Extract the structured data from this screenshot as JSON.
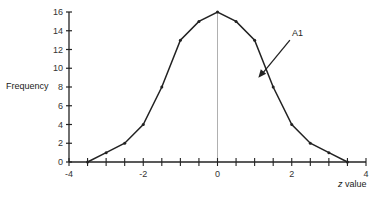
{
  "chart_data": {
    "type": "line",
    "title": "",
    "xlabel_italic": "z",
    "xlabel_rest": " value",
    "xlabel": "z value",
    "ylabel": "Frequency",
    "xlim": [
      -4,
      4
    ],
    "ylim": [
      0,
      16
    ],
    "x_ticks": [
      -4,
      -2,
      0,
      2,
      4
    ],
    "x_minor_step": 0.5,
    "y_ticks": [
      0,
      2,
      4,
      6,
      8,
      10,
      12,
      14,
      16
    ],
    "grid": false,
    "legend": null,
    "series": [
      {
        "name": "Frequency",
        "x": [
          -3.5,
          -3,
          -2.5,
          -2,
          -1.5,
          -1,
          -0.5,
          0,
          0.5,
          1,
          1.5,
          2,
          2.5,
          3,
          3.5
        ],
        "values": [
          0,
          1,
          2,
          4,
          8,
          13,
          15,
          16,
          15,
          13,
          8,
          4,
          2,
          1,
          0
        ]
      }
    ],
    "reference_line": {
      "x": 0,
      "color": "#aaaaaa"
    },
    "annotations": [
      {
        "text": "A1",
        "x_text": 1.95,
        "y_text": 13,
        "arrow_to_x": 1.1,
        "arrow_to_y": 9
      }
    ],
    "colors": {
      "line": "#222222",
      "axis": "#222222",
      "ref": "#b0b0b0"
    }
  }
}
